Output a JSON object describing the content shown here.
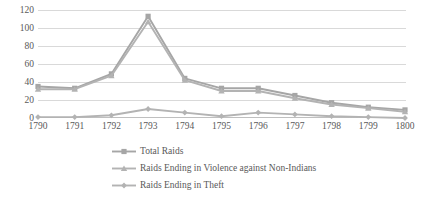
{
  "chart_data": {
    "type": "line",
    "title": "",
    "subtitle": "",
    "xlabel": "",
    "ylabel": "",
    "categories": [
      "1790",
      "1791",
      "1792",
      "1793",
      "1794",
      "1795",
      "1796",
      "1797",
      "1798",
      "1799",
      "1800"
    ],
    "ylim": [
      0,
      120
    ],
    "ytick_labels": [
      "0",
      "20",
      "40",
      "60",
      "80",
      "100",
      "120"
    ],
    "ytick_values": [
      0,
      20,
      40,
      60,
      80,
      100,
      120
    ],
    "grid": true,
    "legend_position": "bottom",
    "series": [
      {
        "name": "Total Raids",
        "marker": "square",
        "color": "#a6a6a6",
        "values": [
          35,
          33,
          49,
          113,
          44,
          33,
          33,
          25,
          17,
          12,
          9
        ]
      },
      {
        "name": "Raids Ending in Violence against Non-Indians",
        "marker": "triangle",
        "color": "#b3b3b3",
        "values": [
          32,
          32,
          47,
          107,
          42,
          30,
          30,
          22,
          15,
          11,
          7
        ]
      },
      {
        "name": "Raids Ending in Theft",
        "marker": "diamond",
        "color": "#b3b3b3",
        "values": [
          1,
          1,
          3,
          10,
          6,
          2,
          6,
          4,
          2,
          1,
          0
        ]
      }
    ]
  },
  "legend": {
    "items": [
      {
        "label": "Total Raids",
        "marker": "square-marker-icon"
      },
      {
        "label": "Raids Ending in Violence against Non-Indians",
        "marker": "triangle-marker-icon"
      },
      {
        "label": "Raids Ending in Theft",
        "marker": "diamond-marker-icon"
      }
    ]
  },
  "colors": {
    "grid": "#d9d9d9",
    "axis": "#bfbfbf",
    "text": "#595959",
    "series_total": "#a6a6a6",
    "series_violence": "#b3b3b3",
    "series_theft": "#b3b3b3"
  }
}
